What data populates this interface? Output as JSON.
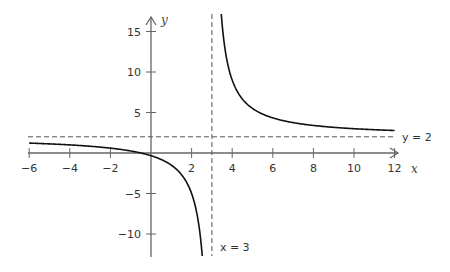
{
  "chart_data": {
    "type": "line",
    "title": "",
    "function": "y = 2 + 7/(x - 3)",
    "xlabel": "x",
    "ylabel": "y",
    "xlim": [
      -6,
      12.5
    ],
    "ylim": [
      -12,
      17
    ],
    "x_ticks": [
      -6,
      -4,
      -2,
      2,
      4,
      6,
      8,
      10,
      12
    ],
    "x_tick_labels": [
      "−6",
      "−4",
      "−2",
      "2",
      "4",
      "6",
      "8",
      "10",
      "12"
    ],
    "y_ticks": [
      15,
      10,
      5,
      -5,
      -10
    ],
    "y_tick_labels": [
      "15",
      "10",
      "5",
      "−5",
      "−10"
    ],
    "grid": false,
    "asymptotes": [
      {
        "type": "vertical",
        "value": 3,
        "label": "x = 3",
        "style": "dashed"
      },
      {
        "type": "horizontal",
        "value": 2,
        "label": "y = 2",
        "style": "dashed"
      }
    ],
    "series": [
      {
        "name": "left branch",
        "x": [
          -6,
          -5,
          -4,
          -3,
          -2,
          -1,
          0,
          1,
          1.5,
          2,
          2.3,
          2.45
        ],
        "y": [
          1.22,
          1.13,
          1.0,
          0.83,
          0.6,
          0.25,
          -0.33,
          -1.5,
          -2.67,
          -5.0,
          -8.0,
          -10.73
        ]
      },
      {
        "name": "right branch",
        "x": [
          3.45,
          3.6,
          4,
          4.5,
          5,
          6,
          7,
          8,
          9,
          10,
          11,
          12
        ],
        "y": [
          17.56,
          13.67,
          9.0,
          6.67,
          5.5,
          4.33,
          3.75,
          3.4,
          3.17,
          3.0,
          2.88,
          2.78
        ]
      }
    ],
    "labels": {
      "x_axis": "x",
      "y_axis": "y",
      "vertical_asymptote": "x = 3",
      "horizontal_asymptote": "y = 2"
    }
  }
}
